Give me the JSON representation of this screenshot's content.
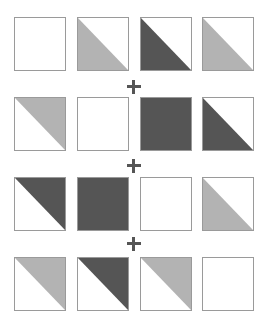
{
  "colors": {
    "light": "#b3b3b3",
    "dark": "#555555",
    "border": "#9a9a9a",
    "blank": "#ffffff"
  },
  "rows": [
    {
      "tiles": [
        {
          "type": "blank"
        },
        {
          "type": "lower-left",
          "shade": "light"
        },
        {
          "type": "lower-left",
          "shade": "dark"
        },
        {
          "type": "lower-left",
          "shade": "light"
        }
      ]
    },
    {
      "tiles": [
        {
          "type": "upper-right",
          "shade": "light"
        },
        {
          "type": "blank"
        },
        {
          "type": "full",
          "shade": "dark"
        },
        {
          "type": "lower-left",
          "shade": "dark"
        }
      ]
    },
    {
      "tiles": [
        {
          "type": "upper-right",
          "shade": "dark"
        },
        {
          "type": "full",
          "shade": "dark"
        },
        {
          "type": "blank"
        },
        {
          "type": "lower-left",
          "shade": "light"
        }
      ]
    },
    {
      "tiles": [
        {
          "type": "upper-right",
          "shade": "light"
        },
        {
          "type": "upper-right",
          "shade": "dark"
        },
        {
          "type": "upper-right",
          "shade": "light"
        },
        {
          "type": "blank"
        }
      ]
    }
  ],
  "operators": [
    "+",
    "+",
    "+"
  ]
}
